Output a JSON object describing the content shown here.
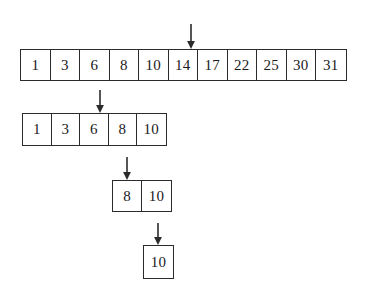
{
  "figure": {
    "kind": "binary-search-array-diagram",
    "background_color": "#ffffff",
    "border_color": "#2b2b2b",
    "text_color": "#1a1a1a",
    "arrow_color": "#2b2b2b"
  },
  "rows": [
    {
      "label": "row-1",
      "values": [
        "1",
        "3",
        "6",
        "8",
        "10",
        "14",
        "17",
        "22",
        "25",
        "30",
        "31"
      ],
      "pointer_index": 5,
      "pointer_value": "14",
      "left": 20,
      "top": 49,
      "cell_width": 29.5,
      "cell_height": 30,
      "font_size": 15
    },
    {
      "label": "row-2",
      "values": [
        "1",
        "3",
        "6",
        "8",
        "10"
      ],
      "pointer_index": 2,
      "pointer_value": "6",
      "left": 22,
      "top": 113,
      "cell_width": 28.5,
      "cell_height": 31,
      "font_size": 15
    },
    {
      "label": "row-3",
      "values": [
        "8",
        "10"
      ],
      "pointer_index": 0,
      "pointer_value": "8",
      "left": 112,
      "top": 180,
      "cell_width": 29,
      "cell_height": 30,
      "font_size": 15
    },
    {
      "label": "row-4",
      "values": [
        "10"
      ],
      "pointer_index": 0,
      "pointer_value": "10",
      "left": 143,
      "top": 245,
      "cell_width": 29,
      "cell_height": 32,
      "font_size": 15
    }
  ],
  "arrows": [
    {
      "label": "pointer-arrow-row-1",
      "left": 185,
      "top": 24,
      "height": 25
    },
    {
      "label": "pointer-arrow-row-2",
      "left": 94,
      "top": 90,
      "height": 23
    },
    {
      "label": "pointer-arrow-row-3",
      "left": 121,
      "top": 157,
      "height": 23
    },
    {
      "label": "pointer-arrow-row-4",
      "left": 152,
      "top": 223,
      "height": 22
    }
  ]
}
